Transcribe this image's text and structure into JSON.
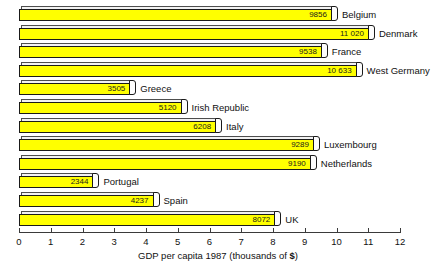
{
  "chart_data": {
    "type": "bar",
    "orientation": "horizontal",
    "title": "",
    "xlabel": "GDP per capita 1987 (thousands of $)",
    "ylabel": "",
    "xlim": [
      0,
      12
    ],
    "xticks": [
      "0",
      "1",
      "2",
      "3",
      "4",
      "5",
      "6",
      "7",
      "8",
      "9",
      "10",
      "11",
      "12"
    ],
    "grid": false,
    "legend": "none",
    "units": "thousands of $",
    "bar_color": "#ffff00",
    "bar_outline_color": "#1a1a1a",
    "categories": [
      "Belgium",
      "Denmark",
      "France",
      "West Germany",
      "Greece",
      "Irish Republic",
      "Italy",
      "Luxembourg",
      "Netherlands",
      "Portugal",
      "Spain",
      "UK"
    ],
    "values": [
      9856,
      11020,
      9538,
      10633,
      3505,
      5120,
      6208,
      9289,
      9190,
      2344,
      4237,
      8072
    ],
    "value_labels": [
      "9856",
      "11 020",
      "9538",
      "10 633",
      "3505",
      "5120",
      "6208",
      "9289",
      "9190",
      "2344",
      "4237",
      "8072"
    ],
    "bars": [
      {
        "label": "Belgium",
        "value": 9856,
        "value_label": "9856"
      },
      {
        "label": "Denmark",
        "value": 11020,
        "value_label": "11 020"
      },
      {
        "label": "France",
        "value": 9538,
        "value_label": "9538"
      },
      {
        "label": "West Germany",
        "value": 10633,
        "value_label": "10 633"
      },
      {
        "label": "Greece",
        "value": 3505,
        "value_label": "3505"
      },
      {
        "label": "Irish Republic",
        "value": 5120,
        "value_label": "5120"
      },
      {
        "label": "Italy",
        "value": 6208,
        "value_label": "6208"
      },
      {
        "label": "Luxembourg",
        "value": 9289,
        "value_label": "9289"
      },
      {
        "label": "Netherlands",
        "value": 9190,
        "value_label": "9190"
      },
      {
        "label": "Portugal",
        "value": 2344,
        "value_label": "2344"
      },
      {
        "label": "Spain",
        "value": 4237,
        "value_label": "4237"
      },
      {
        "label": "UK",
        "value": 8072,
        "value_label": "8072"
      }
    ]
  },
  "axis": {
    "title_main": "GDP per capita 1987 ",
    "title_paren_open": "(thousands of ",
    "title_dollar": "$",
    "title_paren_close": ")"
  }
}
